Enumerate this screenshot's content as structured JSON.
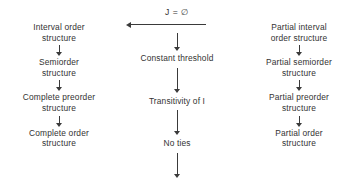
{
  "diagram": {
    "type": "flow-hierarchy",
    "background_color": "#ffffff",
    "text_color": "#333333",
    "arrow_color": "#3a3a3a",
    "columns": [
      {
        "id": "left",
        "name": "complete-structures-chain",
        "nodes": [
          {
            "lines": [
              "Interval order",
              "structure"
            ]
          },
          {
            "lines": [
              "Semiorder",
              "structure"
            ]
          },
          {
            "lines": [
              "Complete preorder",
              "structure"
            ]
          },
          {
            "lines": [
              "Complete order",
              "structure"
            ]
          }
        ]
      },
      {
        "id": "middle",
        "name": "conditions-chain",
        "top_label": "J = ∅",
        "nodes": [
          {
            "lines": [
              "Constant threshold"
            ]
          },
          {
            "lines": [
              "Transitivity  of I"
            ]
          },
          {
            "lines": [
              "No ties"
            ]
          }
        ]
      },
      {
        "id": "right",
        "name": "partial-structures-chain",
        "nodes": [
          {
            "lines": [
              "Partial interval",
              "order structure"
            ]
          },
          {
            "lines": [
              "Partial semiorder",
              "structure"
            ]
          },
          {
            "lines": [
              "Partial preorder",
              "structure"
            ]
          },
          {
            "lines": [
              "Partial order",
              "structure"
            ]
          }
        ]
      }
    ],
    "horizontal_arrow": {
      "name": "j-empty-arrow",
      "direction": "left",
      "label": "J = ∅"
    }
  }
}
